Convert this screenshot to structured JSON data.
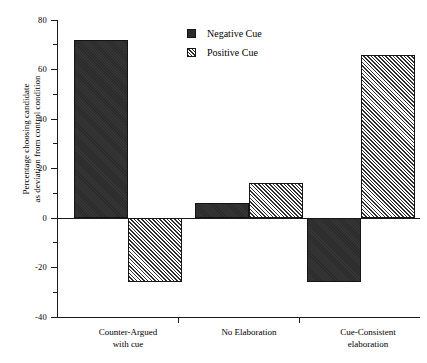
{
  "chart_data": {
    "type": "bar",
    "title": "",
    "xlabel": "",
    "ylabel_line1": "Percentage choosing candidate",
    "ylabel_line2": "as deviation from control condition",
    "categories": [
      {
        "line1": "Counter-Argued",
        "line2": "with cue"
      },
      {
        "line1": "No Elaboration",
        "line2": ""
      },
      {
        "line1": "Cue-Consistent",
        "line2": "elaboration"
      }
    ],
    "series": [
      {
        "name": "Negative Cue",
        "pattern": "solid",
        "color": "#2b2b2b",
        "values": [
          72,
          6,
          -26
        ]
      },
      {
        "name": "Positive Cue",
        "pattern": "hatch",
        "color": "#ffffff",
        "values": [
          -26,
          14,
          66
        ]
      }
    ],
    "ylim": [
      -40,
      80
    ],
    "ytick_major": [
      80,
      60,
      40,
      20,
      0,
      -20,
      -40
    ],
    "ytick_minor": [
      70,
      50,
      30,
      10,
      -10,
      -30
    ],
    "ytick_labels": [
      "80",
      "60",
      "40",
      "20",
      "0",
      "-20",
      "-40"
    ],
    "grid": false,
    "legend_position": "top-center"
  },
  "legend": {
    "items": [
      {
        "label": "Negative Cue"
      },
      {
        "label": "Positive Cue"
      }
    ]
  }
}
